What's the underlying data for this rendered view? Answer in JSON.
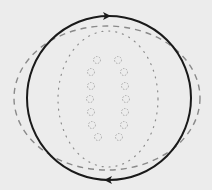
{
  "diagram": {
    "background": "#ececec",
    "solid_circle": {
      "cx": 109,
      "cy": 98,
      "r": 82,
      "stroke": "#1a1a1a",
      "stroke_width": 2
    },
    "arrows": [
      {
        "name": "top-arrow",
        "x": 107,
        "y": 16,
        "direction": "right"
      },
      {
        "name": "bottom-arrow",
        "x": 108,
        "y": 180,
        "direction": "left"
      }
    ],
    "dashed_ellipse": {
      "cx": 107,
      "cy": 98,
      "rx": 93,
      "ry": 72,
      "stroke": "#8a8a8a",
      "stroke_width": 1.4,
      "dash": "6 5"
    },
    "dotted_ellipse": {
      "cx": 108,
      "cy": 99,
      "rx": 50,
      "ry": 68,
      "stroke": "#8c8c8c",
      "stroke_width": 1.2,
      "dash": "1 6"
    },
    "small_circles": {
      "stroke": "#a8a8a8",
      "r": 3.5,
      "left_column": [
        [
          97,
          60
        ],
        [
          91,
          72
        ],
        [
          91,
          86
        ],
        [
          90,
          99
        ],
        [
          91,
          112
        ],
        [
          92,
          125
        ],
        [
          98,
          137
        ]
      ],
      "right_column": [
        [
          118,
          60
        ],
        [
          124,
          72
        ],
        [
          125,
          86
        ],
        [
          126,
          99
        ],
        [
          125,
          112
        ],
        [
          124,
          125
        ],
        [
          119,
          137
        ]
      ]
    }
  }
}
